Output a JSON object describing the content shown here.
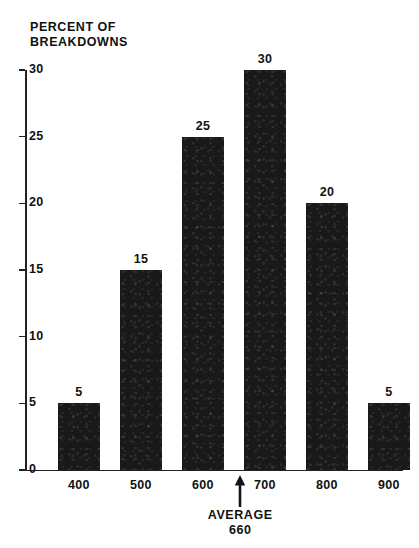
{
  "chart_data": {
    "type": "bar",
    "title": "PERCENT OF\nBREAKDOWNS",
    "xlabel": "",
    "ylabel": "PERCENT OF BREAKDOWNS",
    "categories": [
      "400",
      "500",
      "600",
      "700",
      "800",
      "900"
    ],
    "values": [
      5,
      15,
      25,
      30,
      20,
      5
    ],
    "value_labels": [
      "5",
      "15",
      "25",
      "30",
      "20",
      "5"
    ],
    "ylim": [
      0,
      30
    ],
    "yticks": [
      0,
      5,
      10,
      15,
      20,
      25,
      30
    ],
    "ytick_labels": [
      "0",
      "5",
      "10",
      "15",
      "20",
      "25",
      "30"
    ],
    "grid": false,
    "legend": null,
    "bar_color": "#191919",
    "axis_color": "#222222",
    "background": "#ffffff",
    "annotations": [
      {
        "name": "average-marker",
        "label": "AVERAGE\n660",
        "label_line1": "AVERAGE",
        "label_line2": "660",
        "value": 660,
        "arrow": "up-arrow"
      }
    ]
  }
}
